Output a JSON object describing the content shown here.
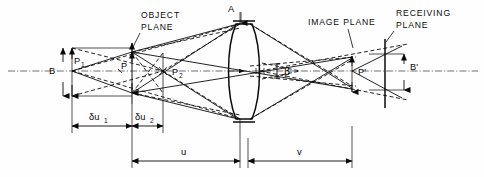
{
  "figure": {
    "type": "optical-ray-diagram"
  },
  "labels": {
    "object_plane": "OBJECT\nPLANE",
    "object_plane_line1": "OBJECT",
    "object_plane_line2": "PLANE",
    "image_plane": "IMAGE PLANE",
    "receiving_plane_line1": "RECEIVING",
    "receiving_plane_line2": "PLANE",
    "point_A": "A",
    "point_B": "B",
    "point_B_prime": "B'",
    "point_P": "P",
    "point_P1": "P",
    "point_P1_sub": "1",
    "point_P2": "P",
    "point_P2_sub": "2",
    "point_P_prime": "P'",
    "angle_beta": "β"
  },
  "dimensions": [
    {
      "name": "delta-u1",
      "symbol": "δu",
      "subscript": "1",
      "label": "δu₁"
    },
    {
      "name": "delta-u2",
      "symbol": "δu",
      "subscript": "2",
      "label": "δu₂"
    },
    {
      "name": "object-distance-u",
      "symbol": "u",
      "subscript": "",
      "label": "u"
    },
    {
      "name": "image-distance-v",
      "symbol": "v",
      "subscript": "",
      "label": "v"
    }
  ],
  "colors": {
    "ink": "#0a0a0a",
    "background": "#fefefe",
    "axis": "#1a1a1a",
    "chain": "#333333"
  },
  "geometry_notes": {
    "axis_y": 71,
    "lens_center_x": 244,
    "object_plane_x": 132,
    "image_plane_x": 352,
    "receiving_plane_x": 385
  }
}
